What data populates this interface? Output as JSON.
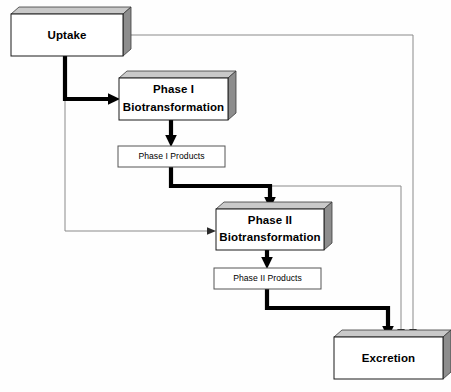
{
  "diagram": {
    "background_color": "#fefefe",
    "bold_flow_color": "#000000",
    "thin_flow_color": "#8a8a8a",
    "bevel_side_color": "#8d8d8d",
    "bevel_top_color": "#c9c9c9",
    "nodes": {
      "uptake": {
        "label": "Uptake",
        "style": "beveled",
        "x": 11,
        "y": 14,
        "w": 112,
        "h": 42
      },
      "phase1": {
        "label_line1": "Phase I",
        "label_line2": "Biotransformation",
        "style": "beveled",
        "x": 119,
        "y": 78,
        "w": 109,
        "h": 42
      },
      "phase1_products": {
        "label": "Phase I Products",
        "style": "plain",
        "x": 118,
        "y": 146,
        "w": 107,
        "h": 21
      },
      "phase2": {
        "label_line1": "Phase II",
        "label_line2": "Biotransformation",
        "style": "beveled",
        "x": 216,
        "y": 209,
        "w": 108,
        "h": 41
      },
      "phase2_products": {
        "label": "Phase II Products",
        "style": "plain",
        "x": 214,
        "y": 268,
        "w": 107,
        "h": 21
      },
      "excretion": {
        "label": "Excretion",
        "style": "beveled",
        "x": 334,
        "y": 337,
        "w": 109,
        "h": 42
      }
    },
    "edges": [
      {
        "name": "uptake-to-phase1",
        "weight": "bold",
        "from": "uptake",
        "to": "phase1"
      },
      {
        "name": "uptake-to-phase2",
        "weight": "thin",
        "from": "uptake",
        "to": "phase2"
      },
      {
        "name": "uptake-to-excretion",
        "weight": "thin",
        "from": "uptake",
        "to": "excretion"
      },
      {
        "name": "phase1-to-phase1-products",
        "weight": "bold",
        "from": "phase1",
        "to": "phase1_products"
      },
      {
        "name": "phase1-products-to-phase2",
        "weight": "bold",
        "from": "phase1_products",
        "to": "phase2"
      },
      {
        "name": "phase1-products-to-excretion",
        "weight": "thin",
        "from": "phase1_products",
        "to": "excretion"
      },
      {
        "name": "phase2-to-phase2-products",
        "weight": "bold",
        "from": "phase2",
        "to": "phase2_products"
      },
      {
        "name": "phase2-products-to-excretion",
        "weight": "bold",
        "from": "phase2_products",
        "to": "excretion"
      }
    ]
  }
}
